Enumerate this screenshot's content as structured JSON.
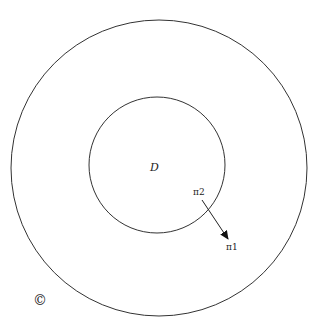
{
  "diagram": {
    "outer_circle": {
      "cx": 159,
      "cy": 168,
      "r": 148
    },
    "inner_circle": {
      "cx": 157,
      "cy": 165,
      "r": 68
    },
    "labels": {
      "region": "D",
      "point_start": "π2",
      "point_end": "π1",
      "copyright": "©"
    },
    "arrow": {
      "x1": 202,
      "y1": 200,
      "x2": 228,
      "y2": 239
    },
    "stroke_color": "#333333"
  }
}
